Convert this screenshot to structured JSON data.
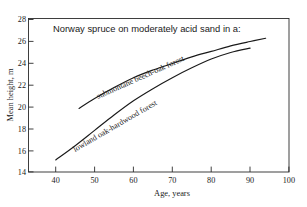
{
  "chart_data": {
    "type": "line",
    "title": "Norway spruce on moderately acid sand in a:",
    "xlabel": "Age, years",
    "ylabel": "Mean height, m",
    "xlim": [
      33,
      100
    ],
    "ylim": [
      14,
      28
    ],
    "xticks": [
      40,
      50,
      60,
      70,
      80,
      90,
      100
    ],
    "xtick_labels": [
      "40",
      "50",
      "60",
      "70",
      "80",
      "90",
      "100"
    ],
    "yticks": [
      14,
      16,
      18,
      20,
      22,
      24,
      26,
      28
    ],
    "ytick_labels": [
      "14",
      "16",
      "18",
      "20",
      "22",
      "24",
      "26",
      "28"
    ],
    "grid": false,
    "legend": "inline-curve-labels",
    "series": [
      {
        "name": "submontane beech-oak forest",
        "label_text": "submontane beech-oak forest",
        "x": [
          46,
          50,
          55,
          60,
          65,
          70,
          75,
          80,
          85,
          90,
          94
        ],
        "y": [
          19.8,
          20.7,
          21.7,
          22.6,
          23.3,
          23.9,
          24.5,
          25.0,
          25.5,
          25.9,
          26.2
        ]
      },
      {
        "name": "lowland oak-hardwood forest",
        "label_text": "lowland oak-hardwood forest",
        "x": [
          40,
          45,
          50,
          55,
          60,
          65,
          70,
          75,
          80,
          85,
          90
        ],
        "y": [
          15.1,
          16.4,
          17.8,
          19.2,
          20.5,
          21.6,
          22.6,
          23.5,
          24.3,
          24.9,
          25.3
        ]
      }
    ]
  },
  "axes": {
    "x_axis_title": "Age, years",
    "y_axis_title": "Mean height, m"
  },
  "colors": {
    "background": "#ffffff",
    "ink": "#1a1a1a",
    "frame": "#2b2b2b"
  }
}
